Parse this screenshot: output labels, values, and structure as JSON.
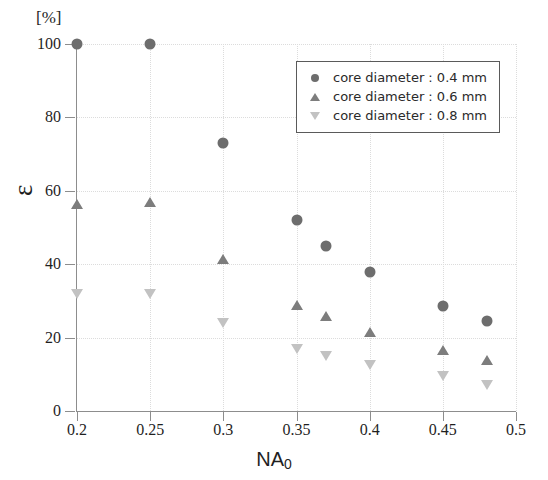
{
  "chart_data": {
    "type": "scatter",
    "title": "",
    "xlabel": "NA",
    "xlabel_sub": "0",
    "ylabel": "ε",
    "yunit": "[%]",
    "xlim": [
      0.2,
      0.5
    ],
    "ylim": [
      0,
      100
    ],
    "xticks": [
      "0.2",
      "0.25",
      "0.3",
      "0.35",
      "0.4",
      "0.45",
      "0.5"
    ],
    "xtick_values": [
      0.2,
      0.25,
      0.3,
      0.35,
      0.4,
      0.45,
      0.5
    ],
    "yticks": [
      "0",
      "20",
      "40",
      "60",
      "80",
      "100"
    ],
    "ytick_values": [
      0,
      20,
      40,
      60,
      80,
      100
    ],
    "grid": true,
    "legend_position": "top-right",
    "series": [
      {
        "name": "core diameter : 0.4 mm",
        "marker": "circle",
        "color": "#6d6d6d",
        "x": [
          0.2,
          0.25,
          0.3,
          0.35,
          0.37,
          0.4,
          0.45,
          0.48
        ],
        "values": [
          100,
          100,
          73,
          52,
          45,
          38,
          28.5,
          24.5
        ]
      },
      {
        "name": "core diameter : 0.6 mm",
        "marker": "triangle-up",
        "color": "#7d7d7d",
        "x": [
          0.2,
          0.25,
          0.3,
          0.35,
          0.37,
          0.4,
          0.45,
          0.48
        ],
        "values": [
          56.5,
          57,
          41.5,
          29,
          26,
          21.5,
          16.5,
          14
        ]
      },
      {
        "name": "core diameter : 0.8 mm",
        "marker": "triangle-down",
        "color": "#c2c2c2",
        "x": [
          0.2,
          0.25,
          0.3,
          0.35,
          0.37,
          0.4,
          0.45,
          0.48
        ],
        "values": [
          32,
          32,
          24,
          17,
          15,
          12.5,
          9.5,
          7
        ]
      }
    ]
  },
  "legend": {
    "entries": [
      {
        "label": "core diameter : 0.4 mm",
        "marker": "circle"
      },
      {
        "label": "core diameter : 0.6 mm",
        "marker": "triangle-up"
      },
      {
        "label": "core diameter : 0.8 mm",
        "marker": "triangle-down"
      }
    ]
  }
}
